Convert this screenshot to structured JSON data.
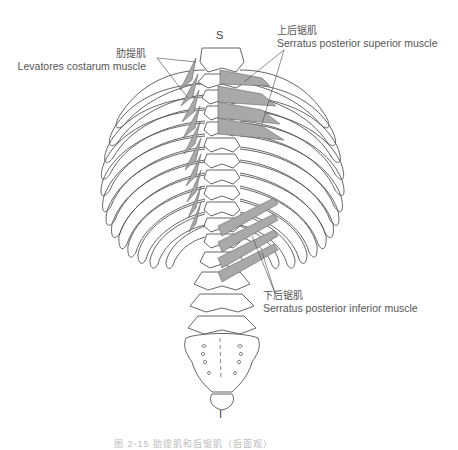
{
  "figure": {
    "top_marker": "S",
    "bottom_marker": "I",
    "labels": {
      "levatores": {
        "zh": "肋提肌",
        "en": "Levatores costarum muscle"
      },
      "serratus_superior": {
        "zh": "上后锯肌",
        "en": "Serratus posterior superior muscle"
      },
      "serratus_inferior": {
        "zh": "下后锯肌",
        "en": "Serratus posterior inferior muscle"
      }
    },
    "caption": "图 2-15  肋提肌和后锯肌（后面观）",
    "colors": {
      "outline": "#555555",
      "muscle_fill": "#a9a9a9",
      "background": "#ffffff"
    }
  }
}
